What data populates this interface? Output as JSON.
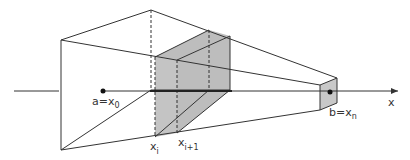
{
  "diagram": {
    "type": "solid-of-revolution-slicing",
    "labels": {
      "a": "a=x",
      "a_sub": "0",
      "b": "b=x",
      "b_sub": "n",
      "xi": "x",
      "xi_sub": "i",
      "xi1": "x",
      "xi1_sub": "i+1",
      "axis": "x"
    },
    "colors": {
      "line": "#333333",
      "slab_fill": "#bdbdbd",
      "end_fill": "#c8c8c8",
      "background": "#ffffff"
    }
  }
}
